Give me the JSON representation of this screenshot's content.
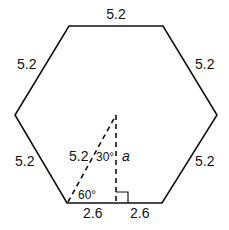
{
  "figure": {
    "shape": "regular hexagon",
    "side_labels": {
      "top": "5.2",
      "upper_left": "5.2",
      "upper_right": "5.2",
      "lower_left": "5.2",
      "lower_right": "5.2"
    },
    "bottom_segment_labels": {
      "left_half": "2.6",
      "right_half": "2.6"
    },
    "triangle": {
      "hypotenuse_label": "5.2",
      "top_angle_label": "30°",
      "bottom_angle_label": "60°",
      "height_label": "a",
      "right_angle_marker": true
    }
  }
}
